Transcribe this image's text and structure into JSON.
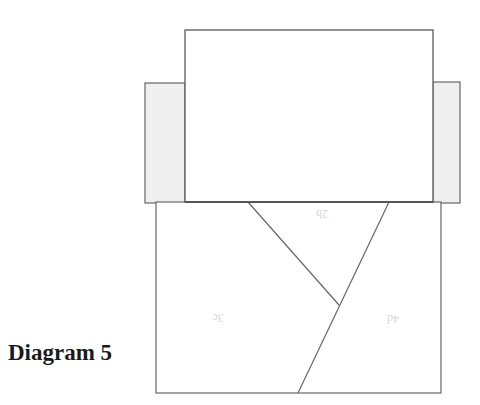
{
  "caption": "Diagram 5",
  "colors": {
    "stroke": "#666666",
    "side_panel_fill": "#efefef",
    "main_fill": "#ffffff",
    "label": "#d8d8d8"
  },
  "pieces": {
    "top_panel": {
      "x": 185,
      "y": 30,
      "w": 248,
      "h": 172
    },
    "left_side_panel": {
      "x": 145,
      "y": 83,
      "w": 40,
      "h": 120
    },
    "right_side_panel": {
      "x": 433,
      "y": 82,
      "w": 27,
      "h": 121
    },
    "bottom_rect": {
      "x": 156,
      "y": 202,
      "w": 285,
      "h": 191
    }
  },
  "cut_lines": [
    {
      "from": [
        248,
        202
      ],
      "to": [
        339,
        305
      ]
    },
    {
      "from": [
        389,
        202
      ],
      "to": [
        298,
        393
      ]
    }
  ],
  "labels": [
    {
      "text": "2b",
      "x": 322,
      "y": 218,
      "rotate": 180
    },
    {
      "text": "3c",
      "x": 218,
      "y": 322,
      "rotate": 180
    },
    {
      "text": "4d",
      "x": 393,
      "y": 323,
      "rotate": 180
    }
  ]
}
